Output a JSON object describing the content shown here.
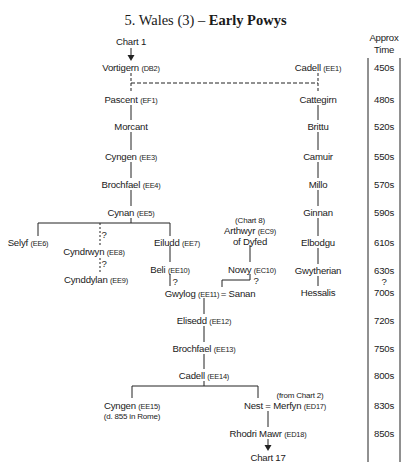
{
  "title": {
    "prefix": "5. Wales (3) – ",
    "bold": "Early Powys"
  },
  "time_column": {
    "header_line1": "Approx",
    "header_line2": "Time",
    "labels": [
      "450s",
      "480s",
      "520s",
      "550s",
      "570s",
      "590s",
      "610s",
      "630s",
      "?",
      "700s",
      "720s",
      "750s",
      "800s",
      "830s",
      "850s"
    ]
  },
  "references": {
    "chart1": "Chart 1",
    "chart8": "(Chart 8)",
    "chart2": "(from Chart 2)",
    "chart17": "Chart 17"
  },
  "nodes": {
    "vortigern": {
      "name": "Vortigern",
      "code": "(DB2)"
    },
    "pascent": {
      "name": "Pascent",
      "code": "(EF1)"
    },
    "morcant": {
      "name": "Morcant",
      "code": ""
    },
    "cyngen1": {
      "name": "Cyngen",
      "code": "(EE3)"
    },
    "brochfael1": {
      "name": "Brochfael",
      "code": "(EE4)"
    },
    "cynan": {
      "name": "Cynan",
      "code": "(EE5)"
    },
    "selyf": {
      "name": "Selyf",
      "code": "(EE6)"
    },
    "cyndrwyn": {
      "name": "Cyndrwyn",
      "code": "(EE8)"
    },
    "cynddylan": {
      "name": "Cynddylan",
      "code": "(EE9)"
    },
    "eiludd": {
      "name": "Eiludd",
      "code": "(EE7)"
    },
    "beli": {
      "name": "Beli",
      "code": "(EE10)"
    },
    "gwylog": {
      "name": "Gwylog",
      "code": "(EE11)"
    },
    "sanan": {
      "name": "= Sanan",
      "code": ""
    },
    "arthwyr": {
      "name": "Arthwyr",
      "code": "(EC9)"
    },
    "of_dyfed": {
      "name": "of Dyfed",
      "code": ""
    },
    "nowy": {
      "name": "Nowy",
      "code": "(EC10)"
    },
    "elisedd": {
      "name": "Elisedd",
      "code": "(EE12)"
    },
    "brochfael2": {
      "name": "Brochfael",
      "code": "(EE13)"
    },
    "cadell2": {
      "name": "Cadell",
      "code": "(EE14)"
    },
    "cyngen2": {
      "name": "Cyngen",
      "code": "(EE15)",
      "note": "(d. 855 in Rome)"
    },
    "nest": {
      "name": "Nest = Merfyn",
      "code": "(ED17)"
    },
    "rhodri": {
      "name": "Rhodri Mawr",
      "code": "(ED18)"
    },
    "cadell1": {
      "name": "Cadell",
      "code": "(EE1)"
    },
    "cattegirn": {
      "name": "Cattegirn",
      "code": ""
    },
    "brittu": {
      "name": "Brittu",
      "code": ""
    },
    "camuir": {
      "name": "Camuir",
      "code": ""
    },
    "millo": {
      "name": "Millo",
      "code": ""
    },
    "ginnan": {
      "name": "Ginnan",
      "code": ""
    },
    "elbodgu": {
      "name": "Elbodgu",
      "code": ""
    },
    "gwytherian": {
      "name": "Gwytherian",
      "code": ""
    },
    "hessalis": {
      "name": "Hessalis",
      "code": ""
    }
  },
  "uncertain_marks": {
    "q": "?"
  }
}
